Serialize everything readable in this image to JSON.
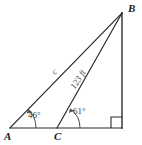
{
  "figure": {
    "type": "geometry-triangle-diagram",
    "background_color": "#ffffff",
    "stroke_color": "#2b2b2b",
    "text_color": "#3a3a3a"
  },
  "vertices": {
    "A": {
      "label": "A",
      "x": 10,
      "y": 128
    },
    "B": {
      "label": "B",
      "x": 122,
      "y": 13
    },
    "C": {
      "label": "C",
      "x": 57,
      "y": 128
    },
    "D": {
      "label": "",
      "x": 122,
      "y": 128
    }
  },
  "angles": {
    "at_A": {
      "label": "46°",
      "value": 46,
      "unit": "degrees",
      "vertex": "A"
    },
    "at_C": {
      "label": "61°",
      "value": 61,
      "unit": "degrees",
      "vertex": "C"
    },
    "at_D": {
      "label": "",
      "value": 90,
      "unit": "degrees",
      "vertex": "D",
      "marker": "right-angle-square"
    }
  },
  "sides": {
    "AB": {
      "label": "c",
      "measure": null
    },
    "CB": {
      "label": "123 ft",
      "measure": 123,
      "unit": "ft"
    }
  },
  "segments": [
    {
      "name": "segment-AD",
      "from": "A",
      "to": "D"
    },
    {
      "name": "segment-AB",
      "from": "A",
      "to": "B"
    },
    {
      "name": "segment-CB",
      "from": "C",
      "to": "B"
    },
    {
      "name": "segment-BD",
      "from": "B",
      "to": "D"
    }
  ]
}
